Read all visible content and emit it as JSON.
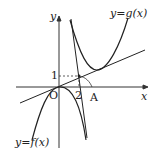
{
  "diagram": {
    "curves": {
      "g_label": "y=g(x)",
      "f_label": "y=f(x)"
    },
    "axes": {
      "x_label": "x",
      "y_label": "y",
      "origin_label": "O"
    },
    "marks": {
      "y_tick": "1",
      "x_tick": "2",
      "point_A": "A"
    },
    "colors": {
      "line": "#222222",
      "axis": "#333333"
    }
  }
}
